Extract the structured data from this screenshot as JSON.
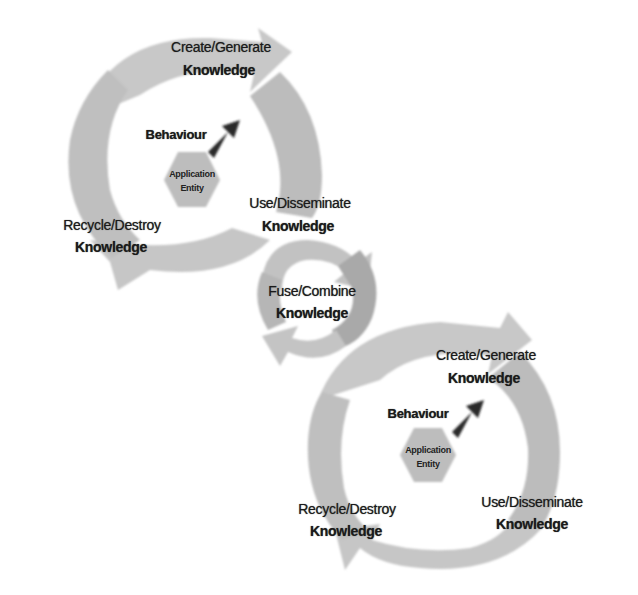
{
  "colors": {
    "background": "#ffffff",
    "cycle_arrow": "#c4c4c4",
    "cycle_arrow_dark": "#b2b2b2",
    "hexagon": "#bdbdbd",
    "behaviour_arrow": "#2a2a2a",
    "text": "#1a1a1a"
  },
  "top_cycle": {
    "create": {
      "line1": "Create/Generate",
      "line2": "Knowledge"
    },
    "behaviour": "Behaviour",
    "entity": {
      "line1": "Application",
      "line2": "Entity"
    },
    "use": {
      "line1": "Use/Disseminate",
      "line2": "Knowledge"
    },
    "recycle": {
      "line1": "Recycle/Destroy",
      "line2": "Knowledge"
    }
  },
  "fuse_cycle": {
    "fuse": {
      "line1": "Fuse/Combine",
      "line2": "Knowledge"
    }
  },
  "bottom_cycle": {
    "create": {
      "line1": "Create/Generate",
      "line2": "Knowledge"
    },
    "behaviour": "Behaviour",
    "entity": {
      "line1": "Application",
      "line2": "Entity"
    },
    "use": {
      "line1": "Use/Disseminate",
      "line2": "Knowledge"
    },
    "recycle": {
      "line1": "Recycle/Destroy",
      "line2": "Knowledge"
    }
  }
}
